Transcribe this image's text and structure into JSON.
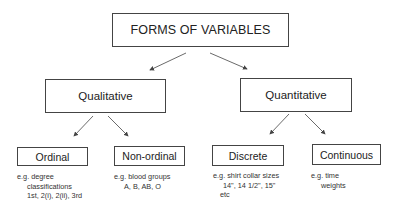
{
  "diagram": {
    "title": "FORMS OF VARIABLES",
    "categories": [
      {
        "label": "Qualitative",
        "children": [
          {
            "label": "Ordinal",
            "example_lines": [
              "e.g. degree",
              "classifications",
              "1st, 2(i), 2(ii), 3rd"
            ]
          },
          {
            "label": "Non-ordinal",
            "example_lines": [
              "e.g. blood groups",
              "A, B, AB, O"
            ]
          }
        ]
      },
      {
        "label": "Quantitative",
        "children": [
          {
            "label": "Discrete",
            "example_lines": [
              "e.g. shirt collar sizes",
              "14\", 14 1/2\", 15\"",
              "etc"
            ]
          },
          {
            "label": "Continuous",
            "example_lines": [
              "e.g. time",
              "weights"
            ]
          }
        ]
      }
    ],
    "colors": {
      "line": "#444444",
      "text": "#222222",
      "background": "#ffffff"
    }
  }
}
